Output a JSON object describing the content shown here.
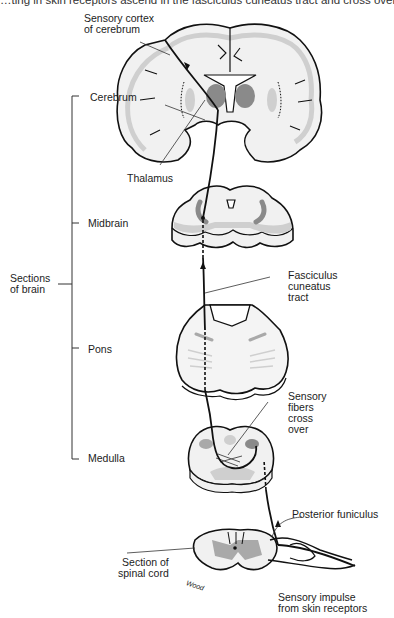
{
  "caption": {
    "text": "…ting in skin receptors ascend in the fasciculus cuneatus tract and cross over in the m"
  },
  "colors": {
    "outline": "#111111",
    "tissue_fill": "#f1f1f1",
    "light_gray": "#cfcfcf",
    "mid_gray": "#a9a9a9",
    "dark_gray": "#8a8a8a",
    "pointer_line": "#333333"
  },
  "bracket": {
    "group_label": "Sections\nof brain",
    "sections": [
      {
        "label": "Cerebrum"
      },
      {
        "label": "Midbrain"
      },
      {
        "label": "Pons"
      },
      {
        "label": "Medulla"
      }
    ]
  },
  "labels": {
    "sensory_cortex": "Sensory cortex\nof cerebrum",
    "thalamus": "Thalamus",
    "fasciculus_cuneatus": "Fasciculus\ncuneatus\ntract",
    "sensory_fibers_cross": "Sensory\nfibers\ncross\nover",
    "posterior_funiculus": "Posterior funiculus",
    "section_spinal_cord": "Section of\nspinal cord",
    "sensory_impulse": "Sensory impulse\nfrom skin receptors",
    "artist_signature": "Wood"
  }
}
